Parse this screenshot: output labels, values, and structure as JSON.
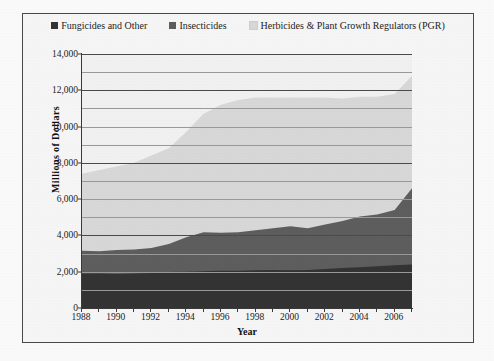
{
  "chart_data": {
    "type": "area",
    "stacked": true,
    "title": "",
    "subtitle": "",
    "xlabel": "Year",
    "ylabel": "Millions of Dollars",
    "xlim": [
      1988,
      2007
    ],
    "ylim": [
      0,
      14000
    ],
    "grid": true,
    "legend_position": "top",
    "x": [
      1988,
      1989,
      1990,
      1991,
      1992,
      1993,
      1994,
      1995,
      1996,
      1997,
      1998,
      1999,
      2000,
      2001,
      2002,
      2003,
      2004,
      2005,
      2006,
      2007
    ],
    "x_ticks": [
      "1988",
      "1990",
      "1992",
      "1994",
      "1996",
      "1998",
      "2000",
      "2002",
      "2004",
      "2006"
    ],
    "y_ticks": [
      "0",
      "2,000",
      "4,000",
      "6,000",
      "8,000",
      "10,000",
      "12,000",
      "14,000"
    ],
    "series": [
      {
        "name": "Fungicides and Other",
        "color": "#333333",
        "values": [
          1900,
          1900,
          1880,
          1900,
          1930,
          1980,
          2000,
          2020,
          2050,
          2060,
          2080,
          2100,
          2080,
          2100,
          2150,
          2200,
          2250,
          2300,
          2350,
          2400
        ]
      },
      {
        "name": "Insecticides",
        "color": "#5e5e5e",
        "values": [
          1250,
          1230,
          1320,
          1320,
          1380,
          1550,
          1900,
          2150,
          2100,
          2120,
          2200,
          2300,
          2420,
          2300,
          2450,
          2600,
          2800,
          2850,
          3050,
          4200
        ]
      },
      {
        "name": "Herbicides & Plant Growth Regulators (PGR)",
        "color": "#d9d9d9",
        "values": [
          4250,
          4470,
          4600,
          4780,
          5090,
          5270,
          5800,
          6530,
          7050,
          7280,
          7320,
          7200,
          7100,
          7200,
          7000,
          6750,
          6600,
          6500,
          6400,
          6200
        ]
      }
    ],
    "totals": [
      7400,
      7600,
      7800,
      8000,
      8400,
      8800,
      9700,
      10700,
      11200,
      11460,
      11600,
      11600,
      11600,
      11600,
      11600,
      11550,
      11650,
      11650,
      11800,
      12800
    ]
  },
  "legend": {
    "items": [
      {
        "label": "Fungicides and Other",
        "color": "#333333"
      },
      {
        "label": "Insecticides",
        "color": "#5e5e5e"
      },
      {
        "label": "Herbicides & Plant Growth Regulators (PGR)",
        "color": "#d9d9d9"
      }
    ]
  },
  "axes": {
    "y_title": "Millions of Dollars",
    "x_title": "Year"
  }
}
